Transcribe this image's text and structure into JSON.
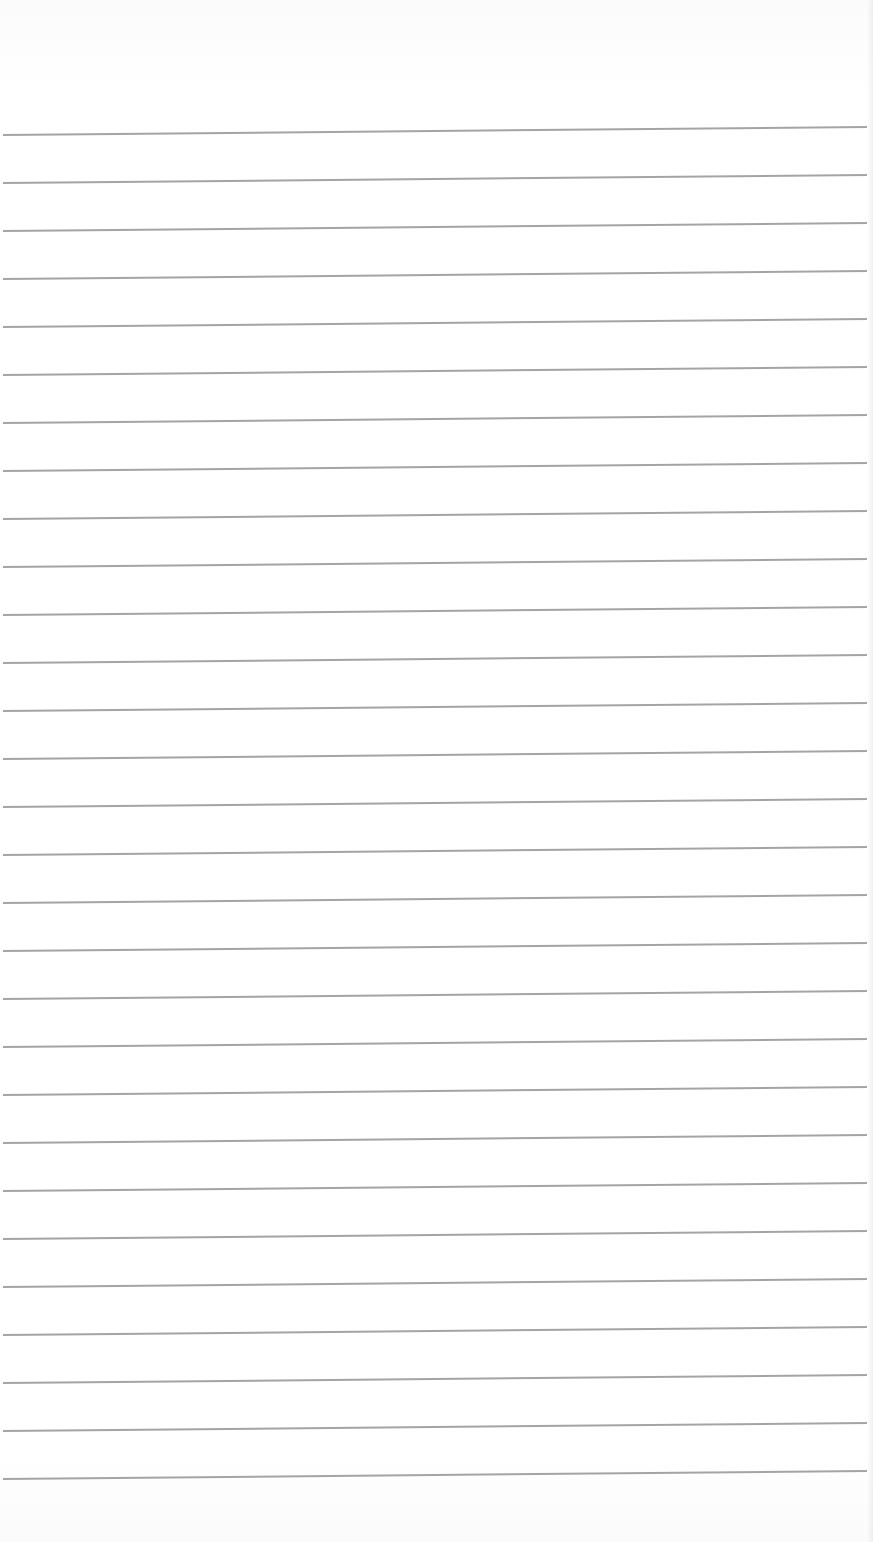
{
  "document": {
    "type": "lined-paper",
    "background_color": "#ffffff",
    "rule_color": "#9a9a9a",
    "rule_count": 29,
    "first_rule_y": 134,
    "rule_spacing": 48,
    "text_content": ""
  }
}
